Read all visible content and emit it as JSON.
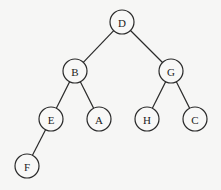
{
  "diagram": {
    "type": "binary-tree",
    "colors": {
      "background": "#f6f6f5",
      "stroke": "#2a2a2a",
      "node_fill": "#f8f8f7",
      "text": "#222222"
    },
    "node_radius": 12,
    "nodes": [
      {
        "id": "D",
        "label": "D",
        "x": 122,
        "y": 22
      },
      {
        "id": "B",
        "label": "B",
        "x": 75,
        "y": 71
      },
      {
        "id": "G",
        "label": "G",
        "x": 171,
        "y": 71
      },
      {
        "id": "E",
        "label": "E",
        "x": 51,
        "y": 119
      },
      {
        "id": "A",
        "label": "A",
        "x": 99,
        "y": 119
      },
      {
        "id": "H",
        "label": "H",
        "x": 147,
        "y": 119
      },
      {
        "id": "C",
        "label": "C",
        "x": 195,
        "y": 119
      },
      {
        "id": "F",
        "label": "F",
        "x": 27,
        "y": 166
      }
    ],
    "edges": [
      {
        "from": "D",
        "to": "B"
      },
      {
        "from": "D",
        "to": "G"
      },
      {
        "from": "B",
        "to": "E"
      },
      {
        "from": "B",
        "to": "A"
      },
      {
        "from": "G",
        "to": "H"
      },
      {
        "from": "G",
        "to": "C"
      },
      {
        "from": "E",
        "to": "F"
      }
    ]
  }
}
